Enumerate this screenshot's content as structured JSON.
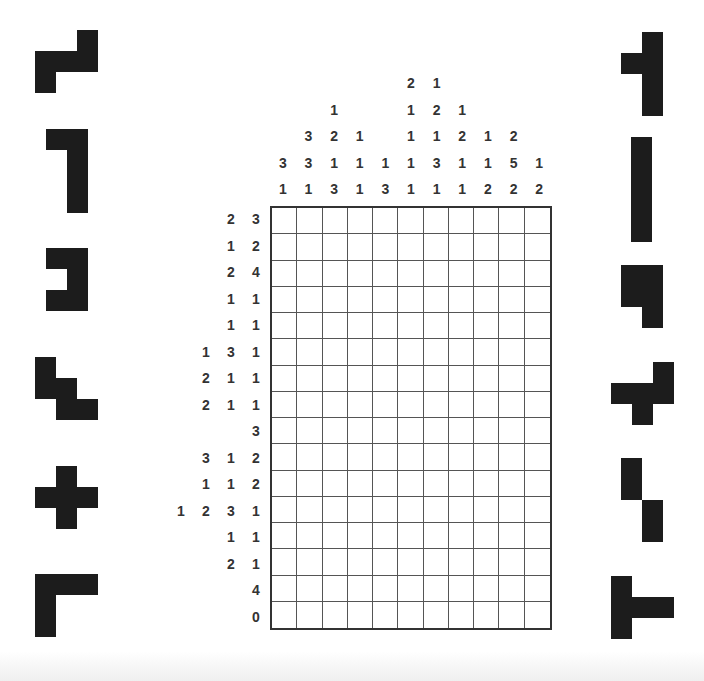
{
  "puzzle": {
    "type": "nonogram-pentomino",
    "rows": 16,
    "cols": 11,
    "column_clues": [
      [
        3,
        1
      ],
      [
        3,
        3,
        1
      ],
      [
        1,
        2,
        1,
        3
      ],
      [
        1,
        1,
        1
      ],
      [
        1,
        3
      ],
      [
        2,
        1,
        1,
        1,
        1
      ],
      [
        1,
        2,
        1,
        3,
        1
      ],
      [
        1,
        2,
        1,
        1
      ],
      [
        1,
        1,
        2
      ],
      [
        2,
        5,
        2
      ],
      [
        1,
        2
      ]
    ],
    "row_clues": [
      [
        2,
        3
      ],
      [
        1,
        2
      ],
      [
        2,
        4
      ],
      [
        1,
        1
      ],
      [
        1,
        1
      ],
      [
        1,
        3,
        1
      ],
      [
        2,
        1,
        1
      ],
      [
        2,
        1,
        1
      ],
      [
        3
      ],
      [
        3,
        1,
        2
      ],
      [
        1,
        1,
        2
      ],
      [
        1,
        2,
        3,
        1
      ],
      [
        1,
        1
      ],
      [
        2,
        1
      ],
      [
        4
      ],
      [
        0
      ]
    ]
  },
  "pieces_left": [
    {
      "name": "Z",
      "cells": [
        [
          0,
          2
        ],
        [
          1,
          0
        ],
        [
          1,
          1
        ],
        [
          1,
          2
        ],
        [
          2,
          0
        ]
      ],
      "x": 35,
      "y": 30
    },
    {
      "name": "L",
      "cells": [
        [
          0,
          0
        ],
        [
          0,
          1
        ],
        [
          1,
          1
        ],
        [
          2,
          1
        ],
        [
          3,
          1
        ]
      ],
      "x": 46,
      "y": 129
    },
    {
      "name": "U",
      "cells": [
        [
          0,
          0
        ],
        [
          0,
          1
        ],
        [
          1,
          1
        ],
        [
          2,
          0
        ],
        [
          2,
          1
        ]
      ],
      "x": 46,
      "y": 248
    },
    {
      "name": "W",
      "cells": [
        [
          0,
          0
        ],
        [
          1,
          0
        ],
        [
          1,
          1
        ],
        [
          2,
          1
        ],
        [
          2,
          2
        ]
      ],
      "x": 35,
      "y": 357
    },
    {
      "name": "X",
      "cells": [
        [
          0,
          1
        ],
        [
          1,
          0
        ],
        [
          1,
          1
        ],
        [
          1,
          2
        ],
        [
          2,
          1
        ]
      ],
      "x": 35,
      "y": 466
    },
    {
      "name": "V",
      "cells": [
        [
          0,
          0
        ],
        [
          0,
          1
        ],
        [
          0,
          2
        ],
        [
          1,
          0
        ],
        [
          2,
          0
        ]
      ],
      "x": 35,
      "y": 574
    }
  ],
  "pieces_right": [
    {
      "name": "Y",
      "cells": [
        [
          0,
          1
        ],
        [
          1,
          0
        ],
        [
          1,
          1
        ],
        [
          2,
          1
        ],
        [
          3,
          1
        ]
      ],
      "x": 621,
      "y": 32
    },
    {
      "name": "I",
      "cells": [
        [
          0,
          0
        ],
        [
          1,
          0
        ],
        [
          2,
          0
        ],
        [
          3,
          0
        ],
        [
          4,
          0
        ]
      ],
      "x": 631,
      "y": 137
    },
    {
      "name": "P",
      "cells": [
        [
          0,
          0
        ],
        [
          0,
          1
        ],
        [
          1,
          0
        ],
        [
          1,
          1
        ],
        [
          2,
          1
        ]
      ],
      "x": 621,
      "y": 265
    },
    {
      "name": "F",
      "cells": [
        [
          0,
          2
        ],
        [
          1,
          0
        ],
        [
          1,
          1
        ],
        [
          1,
          2
        ],
        [
          2,
          1
        ]
      ],
      "x": 611,
      "y": 362
    },
    {
      "name": "N",
      "cells": [
        [
          0,
          0
        ],
        [
          1,
          0
        ],
        [
          2,
          1
        ],
        [
          3,
          1
        ]
      ],
      "x": 621,
      "y": 458
    },
    {
      "name": "T",
      "cells": [
        [
          0,
          0
        ],
        [
          1,
          0
        ],
        [
          1,
          1
        ],
        [
          1,
          2
        ],
        [
          2,
          0
        ]
      ],
      "x": 611,
      "y": 576
    }
  ],
  "colors": {
    "piece_fill": "#1c1c1c",
    "clue_text": "#333333",
    "grid_line": "#555555",
    "background": "#ffffff"
  }
}
